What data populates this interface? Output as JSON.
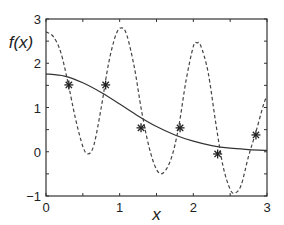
{
  "chart_data": {
    "type": "line",
    "title": "",
    "xlabel": "x",
    "ylabel": "f(x)",
    "xlim": [
      0,
      3
    ],
    "ylim": [
      -1,
      3
    ],
    "xticks": [
      0,
      1,
      2,
      3
    ],
    "yticks": [
      -1,
      0,
      1,
      2,
      3
    ],
    "xtick_labels": [
      "0",
      "1",
      "2",
      "3"
    ],
    "ytick_labels": [
      "−1",
      "0",
      "1",
      "2",
      "3"
    ],
    "grid": false,
    "legend": "none",
    "series": [
      {
        "name": "solid-curve",
        "style": "solid",
        "color": "#333333",
        "x": [
          0,
          0.25,
          0.5,
          0.75,
          1.0,
          1.25,
          1.5,
          1.75,
          2.0,
          2.25,
          2.5,
          2.75,
          3.0
        ],
        "y": [
          1.76,
          1.71,
          1.56,
          1.34,
          1.08,
          0.81,
          0.57,
          0.38,
          0.24,
          0.14,
          0.08,
          0.05,
          0.03
        ]
      },
      {
        "name": "dashed-curve",
        "style": "dashed",
        "color": "#444444",
        "x": [
          0,
          0.1,
          0.2,
          0.3,
          0.4,
          0.5,
          0.57,
          0.65,
          0.75,
          0.85,
          0.95,
          1.03,
          1.1,
          1.2,
          1.3,
          1.4,
          1.5,
          1.59,
          1.7,
          1.8,
          1.9,
          2.0,
          2.05,
          2.1,
          2.2,
          2.3,
          2.4,
          2.5,
          2.57,
          2.65,
          2.75,
          2.85,
          2.95,
          3.0
        ],
        "y": [
          2.71,
          2.6,
          2.25,
          1.55,
          0.75,
          0.12,
          -0.05,
          0.15,
          1.0,
          2.0,
          2.65,
          2.8,
          2.62,
          1.9,
          0.9,
          0.1,
          -0.4,
          -0.48,
          -0.15,
          0.55,
          1.6,
          2.38,
          2.46,
          2.4,
          1.8,
          0.7,
          -0.3,
          -0.85,
          -0.93,
          -0.75,
          -0.1,
          0.45,
          1.05,
          1.26
        ]
      },
      {
        "name": "sample-points",
        "style": "markers",
        "marker": "asterisk",
        "color": "#222222",
        "x": [
          0.31,
          0.81,
          1.29,
          1.82,
          2.33,
          2.85
        ],
        "y": [
          1.51,
          1.51,
          0.54,
          0.54,
          -0.05,
          0.38
        ]
      }
    ]
  }
}
